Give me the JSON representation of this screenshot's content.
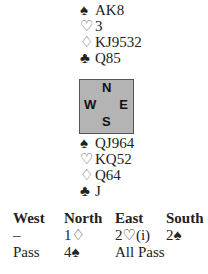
{
  "north": {
    "spades": {
      "symbol": "♠",
      "cards": "AK8"
    },
    "hearts": {
      "symbol": "♡",
      "cards": "3"
    },
    "diamonds": {
      "symbol": "♢",
      "cards": "KJ9532"
    },
    "clubs": {
      "symbol": "♣",
      "cards": "Q85"
    }
  },
  "compass": {
    "n": "N",
    "w": "W",
    "e": "E",
    "s": "S"
  },
  "south": {
    "spades": {
      "symbol": "♠",
      "cards": "QJ964"
    },
    "hearts": {
      "symbol": "♡",
      "cards": "KQ52"
    },
    "diamonds": {
      "symbol": "♢",
      "cards": "Q64"
    },
    "clubs": {
      "symbol": "♣",
      "cards": "J"
    }
  },
  "auction": {
    "headers": [
      "West",
      "North",
      "East",
      "South"
    ],
    "rows": [
      [
        "–",
        "1♢",
        "2♡(i)",
        "2♠"
      ],
      [
        "Pass",
        "4♠",
        "All Pass",
        ""
      ]
    ]
  }
}
